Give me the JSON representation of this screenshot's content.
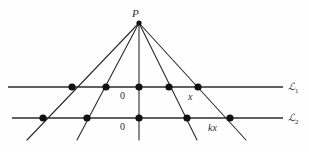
{
  "figure": {
    "background_color": "#fefefe",
    "stroke_color": "#2b2b2b",
    "width": 309,
    "height": 152
  },
  "apex": {
    "label": "P",
    "x": 139,
    "y": 23
  },
  "lines": [
    {
      "id": "L1",
      "label": "ℒ",
      "subscript": "1",
      "y": 87,
      "x_start": 8,
      "x_end": 283
    },
    {
      "id": "L2",
      "label": "ℒ",
      "subscript": "2",
      "y": 118,
      "x_start": 12,
      "x_end": 283
    }
  ],
  "rays": [
    {
      "id": "ray-far-left",
      "x_at_L1": 72,
      "x_at_L2": 43,
      "x_end": 27,
      "y_end": 140
    },
    {
      "id": "ray-left",
      "x_at_L1": 106,
      "x_at_L2": 87,
      "x_end": 77,
      "y_end": 140
    },
    {
      "id": "ray-center",
      "x_at_L1": 139,
      "x_at_L2": 139,
      "x_end": 139,
      "y_end": 140
    },
    {
      "id": "ray-right",
      "x_at_L1": 169,
      "x_at_L2": 187,
      "x_end": 197,
      "y_end": 140
    },
    {
      "id": "ray-far-right",
      "x_at_L1": 198,
      "x_at_L2": 230,
      "x_end": 246,
      "y_end": 140
    }
  ],
  "points_L1": [
    {
      "id": "p1-1",
      "x": 72,
      "y": 87,
      "label": ""
    },
    {
      "id": "p1-2",
      "x": 106,
      "y": 87,
      "label": ""
    },
    {
      "id": "p1-3",
      "x": 139,
      "y": 87,
      "label": "0"
    },
    {
      "id": "p1-4",
      "x": 169,
      "y": 87,
      "label": ""
    },
    {
      "id": "p1-5",
      "x": 198,
      "y": 87,
      "label": "x"
    }
  ],
  "points_L2": [
    {
      "id": "p2-1",
      "x": 43,
      "y": 118,
      "label": ""
    },
    {
      "id": "p2-2",
      "x": 87,
      "y": 118,
      "label": ""
    },
    {
      "id": "p2-3",
      "x": 139,
      "y": 118,
      "label": "0"
    },
    {
      "id": "p2-4",
      "x": 187,
      "y": 118,
      "label": ""
    },
    {
      "id": "p2-5",
      "x": 230,
      "y": 118,
      "label": "kx"
    }
  ],
  "labels": {
    "apex": "P",
    "origin_line1": "0",
    "origin_line2": "0",
    "point_x": "x",
    "point_kx": "kx",
    "line1_name": "ℒ",
    "line1_sub": "1",
    "line2_name": "ℒ",
    "line2_sub": "2"
  }
}
